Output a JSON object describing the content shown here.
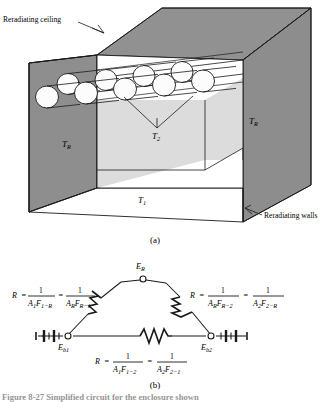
{
  "figure": {
    "panel_a_label": "(a)",
    "panel_b_label": "(b)",
    "caption": "Figure 8-27   Simplified circuit for the enclosure shown"
  },
  "panel_a": {
    "callouts": {
      "ceiling": "Reradiating ceiling",
      "walls": "Reradiating walls"
    },
    "temperatures": {
      "left_wall": "T",
      "left_wall_sub": "R",
      "right_wall": "T",
      "right_wall_sub": "R",
      "tubes": "T",
      "tubes_sub": "2",
      "floor": "T",
      "floor_sub": "1"
    },
    "tube_bank": {
      "back_row_count": 4,
      "front_row_count": 5
    },
    "colors": {
      "wall_shade": "#8e8e8e",
      "ceiling_shade": "#8a8a8a",
      "back_panel_shade": "#d8d8d8",
      "floor_shade": "#ffffff",
      "tube_fill": "#fbfbfb",
      "stroke": "#1a1a1a"
    }
  },
  "panel_b": {
    "formulas": {
      "left": {
        "lhs": "R",
        "eq1": "=",
        "n1": "1",
        "d1_a": "A",
        "d1_a_sub": "1",
        "d1_f": "F",
        "d1_f_sub": "1−R",
        "eq2": "=",
        "n2": "1",
        "d2_a": "A",
        "d2_a_sub": "R",
        "d2_f": "F",
        "d2_f_sub": "R−1"
      },
      "right": {
        "lhs": "R",
        "eq1": "=",
        "n1": "1",
        "d1_a": "A",
        "d1_a_sub": "R",
        "d1_f": "F",
        "d1_f_sub": "R−2",
        "eq2": "=",
        "n2": "1",
        "d2_a": "A",
        "d2_a_sub": "2",
        "d2_f": "F",
        "d2_f_sub": "2−R"
      },
      "bottom": {
        "lhs": "R",
        "eq1": "=",
        "n1": "1",
        "d1_a": "A",
        "d1_a_sub": "1",
        "d1_f": "F",
        "d1_f_sub": "1−2",
        "eq2": "=",
        "n2": "1",
        "d2_a": "A",
        "d2_a_sub": "2",
        "d2_f": "F",
        "d2_f_sub": "2−1"
      }
    },
    "nodes": {
      "top": "E",
      "top_sub": "R",
      "left": "E",
      "left_sub": "b1",
      "right": "E",
      "right_sub": "b2"
    },
    "elements": {
      "resistor_count": 3,
      "battery_count": 2
    }
  }
}
